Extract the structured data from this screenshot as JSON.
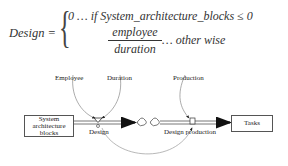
{
  "equation": {
    "lhs": "Design =",
    "case1": "0 … if  System_architecture_blocks  ≤ 0",
    "numerator": "employee",
    "denominator": "duration",
    "case2": "… other wise"
  },
  "diagram": {
    "stock_left": "System architecture blocks",
    "stock_right": "Tasks",
    "flow1": "Design",
    "flow2": "Design production",
    "aux_employee": "Employee",
    "aux_duration": "Duration",
    "aux_production": "Production"
  }
}
